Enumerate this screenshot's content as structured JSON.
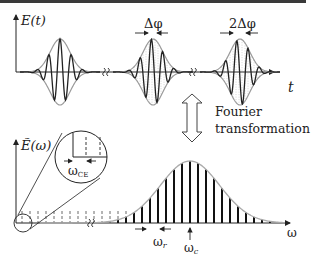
{
  "figure": {
    "top_panel": {
      "y_axis_label": "E(t)",
      "x_axis_label": "t",
      "pulse_annotations": [
        "Δφ",
        "2Δφ"
      ],
      "pulses": [
        {
          "center_x": 60,
          "phase_shift": 0
        },
        {
          "center_x": 153,
          "phase_shift": 1
        },
        {
          "center_x": 240,
          "phase_shift": 2
        }
      ]
    },
    "transform": {
      "line1": "Fourier",
      "line2": "transformation"
    },
    "bottom_panel": {
      "y_axis_label": "Ẽ(ω)",
      "x_axis_label": "ω",
      "inset_label": "ω",
      "inset_label_sub": "CE",
      "rep_rate_label": "ω",
      "rep_rate_sub": "r",
      "center_label": "ω",
      "center_sub": "c"
    },
    "colors": {
      "line": "#222222",
      "envelope": "#9a9a9a",
      "dotted": "#888888",
      "top_bar": "#3a3a3a"
    }
  }
}
